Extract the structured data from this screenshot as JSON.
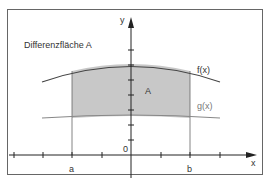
{
  "title": "Differenzfläche A",
  "area_label": "A",
  "curves": {
    "f": {
      "label": "f(x)",
      "color": "#444444"
    },
    "g": {
      "label": "g(x)",
      "color": "#888888"
    }
  },
  "axes": {
    "x_label": "x",
    "y_label": "y",
    "origin_label": "0",
    "a_label": "a",
    "b_label": "b"
  },
  "colors": {
    "fill": "#c8c8c8",
    "frame": "#555555",
    "axis": "#222222"
  }
}
